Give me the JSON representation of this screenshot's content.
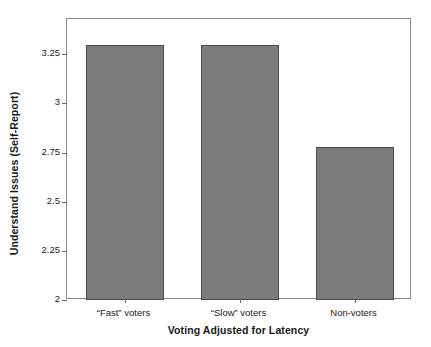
{
  "chart_data": {
    "type": "bar",
    "title": "",
    "xlabel": "Voting Adjusted for Latency",
    "ylabel": "Understand Issues (Self-Report)",
    "categories": [
      "“Fast” voters",
      "“Slow” voters",
      "Non-voters"
    ],
    "values": [
      3.3,
      3.3,
      2.78
    ],
    "ylim": [
      2,
      3.43
    ],
    "yticks": [
      2,
      2.25,
      2.5,
      2.75,
      3,
      3.25
    ],
    "ytick_labels": [
      "2",
      "2.25",
      "2.5",
      "2.75",
      "3",
      "3.25"
    ],
    "grid": false,
    "legend": null,
    "bar_color": "#7c7c7c",
    "bar_edge_color": "#4b4b4b",
    "frame_color": "#8a8a8a",
    "background": "#ffffff"
  },
  "axis": {
    "y_title": "Understand Issues (Self-Report)",
    "x_title": "Voting Adjusted for Latency"
  }
}
